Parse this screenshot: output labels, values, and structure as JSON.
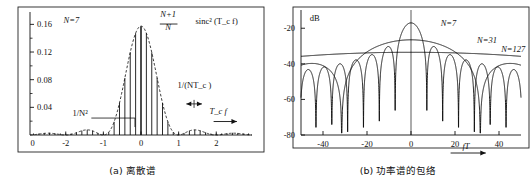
{
  "figure": {
    "panels": [
      {
        "id": "panel-a",
        "caption": "(a) 离散谱",
        "chart_data": {
          "type": "line",
          "title": "",
          "subtitle": "",
          "xlabel": "T_c f",
          "ylabel": "",
          "xlim": [
            -2.95,
            2.95
          ],
          "ylim": [
            0,
            0.175
          ],
          "grid": false,
          "legend": "none",
          "x_ticks": [
            -2,
            -1,
            0,
            1,
            2
          ],
          "x_tick_labels": [
            "-2",
            "-1",
            "0",
            "1",
            "2"
          ],
          "x_tick_extra_left": {
            "label": "0",
            "x": -2.88
          },
          "y_ticks": [
            0.04,
            0.08,
            0.12,
            0.16
          ],
          "y_tick_labels": [
            "0.04",
            "0.08",
            "0.12",
            "0.16"
          ],
          "y_minor_ticks": [
            0.02,
            0.06,
            0.1,
            0.14
          ],
          "annotations": [
            {
              "name": "n-value",
              "text": "N=7",
              "x": -1.85,
              "y": 0.162
            },
            {
              "name": "envelope-formula-numerator",
              "text": "N+1",
              "x": 0.72,
              "y": 0.17
            },
            {
              "name": "envelope-formula-denominator",
              "text": "N",
              "x": 0.72,
              "y": 0.152
            },
            {
              "name": "envelope-formula-sinc",
              "text": "sinc² (T_c f)",
              "x": 1.45,
              "y": 0.161
            },
            {
              "name": "line-spacing-label",
              "text": "1/(NT_c )",
              "x": 1.42,
              "y": 0.068
            },
            {
              "name": "floor-level-label",
              "text": "1/N²",
              "x": -1.62,
              "y": 0.028
            },
            {
              "name": "x-axis-label",
              "text": "T_c f",
              "x": 2.05,
              "y": 0.03
            }
          ],
          "envelope": {
            "name": "sinc-squared-envelope",
            "style": "dashed",
            "formula": "(N+1)/N * sinc^2(Tc f)",
            "peak_value": 0.1575,
            "nulls_at": [
              -3,
              -2,
              -1,
              1,
              2,
              3
            ]
          },
          "spectral_lines": {
            "name": "discrete-spectral-lines",
            "spacing": 0.1429,
            "count_per_side": 21,
            "dc_line_value": 0.157,
            "floor_value": 0.0204,
            "description": "Discrete lines at multiples of 1/(N Tc) with sinc^2 envelope"
          }
        }
      },
      {
        "id": "panel-b",
        "caption": "(b) 功率谱的包络",
        "chart_data": {
          "type": "line",
          "title": "",
          "subtitle": "dB",
          "xlabel": "fT",
          "ylabel": "dB",
          "xlim": [
            -50,
            50
          ],
          "ylim": [
            -80,
            -12
          ],
          "grid": false,
          "legend": "inline-labels",
          "x_ticks": [
            -40,
            -20,
            0,
            20,
            40
          ],
          "x_tick_labels": [
            "-40",
            "-20",
            "0",
            "20",
            "40"
          ],
          "y_ticks": [
            -20,
            -40,
            -60,
            -80
          ],
          "y_tick_labels": [
            "-20",
            "-40",
            "-60",
            "-80"
          ],
          "series": [
            {
              "name": "N=7",
              "label": "N=7",
              "peak_db": -17.0,
              "null_spacing": 7.2,
              "label_x": 13.5,
              "label_y": -19.0
            },
            {
              "name": "N=31",
              "label": "N=31",
              "peak_db": -26.5,
              "null_spacing": 31.5,
              "label_x": 30.0,
              "label_y": -28.5
            },
            {
              "name": "N=127",
              "label": "N=127",
              "peak_db": -33.5,
              "null_spacing": 128.0,
              "label_x": 41.0,
              "label_y": -33.5
            }
          ],
          "annotations": [
            {
              "name": "db-unit-label",
              "text": "dB",
              "x": -46,
              "y": -16
            },
            {
              "name": "x-axis-label",
              "text": "fT",
              "x": 27,
              "y": -85
            }
          ]
        }
      }
    ]
  }
}
